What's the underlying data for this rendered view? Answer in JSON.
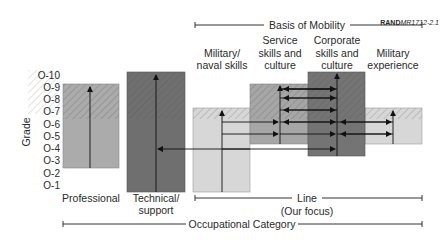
{
  "figure_code": {
    "bold": "RAND",
    "rest": "MR1712-2.1"
  },
  "y_axis": {
    "label": "Grade",
    "ticks": [
      "O-10",
      "O-9",
      "O-8",
      "O-7",
      "O-6",
      "O-5",
      "O-4",
      "O-3",
      "O-2",
      "O-1"
    ]
  },
  "headers": {
    "basis_of_mobility": "Basis of Mobility",
    "occupational_category": "Occupational Category",
    "line_title": "Line",
    "line_subtitle": "(Our focus)"
  },
  "categories": [
    {
      "id": "professional",
      "label_lines": [
        "Professional"
      ],
      "grade_range": [
        "O-3",
        "O-9"
      ],
      "color": "#a9a9a9"
    },
    {
      "id": "technical",
      "label_lines": [
        "Technical/",
        "support"
      ],
      "grade_range": [
        "O-1",
        "O-10"
      ],
      "color": "#6e6e6e"
    }
  ],
  "mobility_bases": [
    {
      "id": "military-naval",
      "label_lines": [
        "Military/",
        "naval skills"
      ],
      "grade_range": [
        "O-1",
        "O-7"
      ],
      "color": "#d6d6d6"
    },
    {
      "id": "service",
      "label_lines": [
        "Service",
        "skills and",
        "culture"
      ],
      "grade_range": [
        "O-5",
        "O-9"
      ],
      "color": "#a4a4a4"
    },
    {
      "id": "corporate",
      "label_lines": [
        "Corporate",
        "skills and",
        "culture"
      ],
      "grade_range": [
        "O-4",
        "O-10"
      ],
      "color": "#727272"
    },
    {
      "id": "military-experience",
      "label_lines": [
        "Military",
        "experience"
      ],
      "grade_range": [
        "O-5",
        "O-7"
      ],
      "color": "#d6d6d6"
    }
  ],
  "colors": {
    "hatch_light": "#cfcfcf",
    "axis_line": "#333333",
    "background": "#ffffff"
  }
}
